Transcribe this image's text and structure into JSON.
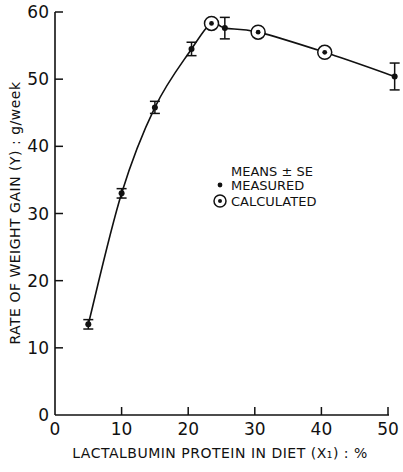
{
  "chart_data": {
    "type": "scatter",
    "title": "",
    "xlabel": "LACTALBUMIN PROTEIN IN DIET (X₁) : %",
    "ylabel": "RATE OF WEIGHT GAIN (Y) : g/week",
    "xlim": [
      0,
      50
    ],
    "ylim": [
      0,
      60
    ],
    "xticks": [
      0,
      10,
      20,
      30,
      40,
      50
    ],
    "yticks": [
      0,
      10,
      20,
      30,
      40,
      50,
      60
    ],
    "grid": false,
    "legend": {
      "position": "center-right",
      "title": "MEANS ± SE",
      "entries": [
        {
          "marker": "dot",
          "label": "MEASURED"
        },
        {
          "marker": "circled-dot",
          "label": "CALCULATED"
        }
      ]
    },
    "series": [
      {
        "name": "MEASURED",
        "marker": "dot",
        "x": [
          5,
          10,
          15,
          20.5,
          25.5,
          51
        ],
        "y": [
          13.5,
          33,
          45.8,
          54.5,
          57.6,
          50.4
        ],
        "se": [
          0.7,
          0.7,
          0.9,
          1.0,
          1.6,
          2.0
        ]
      },
      {
        "name": "CALCULATED",
        "marker": "circled-dot",
        "x": [
          23.5,
          30.5,
          40.5
        ],
        "y": [
          58.3,
          57,
          54
        ],
        "se": [
          0,
          0,
          0
        ]
      },
      {
        "name": "fitted-curve",
        "marker": "line",
        "x": [
          5,
          10,
          15,
          20.5,
          23.5,
          25.5,
          30.5,
          40.5,
          51
        ],
        "y": [
          13.5,
          33,
          45.8,
          54.5,
          58.3,
          57.6,
          57,
          54,
          50.4
        ]
      }
    ]
  }
}
